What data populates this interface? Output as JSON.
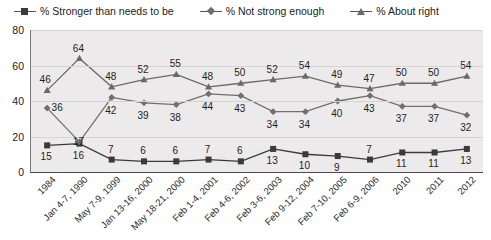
{
  "legend": {
    "position": "top",
    "entries": [
      {
        "label": "% Stronger than needs to be",
        "marker": "square-marker-icon",
        "color": "#3a3a3a"
      },
      {
        "label": "% Not strong enough",
        "marker": "diamond-marker-icon",
        "color": "#6f6f6f"
      },
      {
        "label": "% About right",
        "marker": "triangle-marker-icon",
        "color": "#6a6a6a"
      }
    ]
  },
  "chart_data": {
    "type": "line",
    "title": "",
    "xlabel": "",
    "ylabel": "",
    "ylim": [
      0,
      80
    ],
    "yticks": [
      0,
      20,
      40,
      60,
      80
    ],
    "grid": true,
    "legend_position": "top",
    "categories": [
      "1984",
      "Jan 4-7, 1990",
      "May 7-9, 1999",
      "Jan 13-16, 2000",
      "May 18-21, 2000",
      "Feb 1-4, 2001",
      "Feb 4-6, 2002",
      "Feb 3-6, 2003",
      "Feb 9-12, 2004",
      "Feb 7-10, 2005",
      "Feb 6-9, 2006",
      "2010",
      "2011",
      "2012"
    ],
    "series": [
      {
        "name": "% Stronger than needs to be",
        "marker": "square",
        "color": "#3a3a3a",
        "values": [
          15,
          16,
          7,
          6,
          6,
          7,
          6,
          13,
          10,
          9,
          7,
          11,
          11,
          13
        ]
      },
      {
        "name": "% Not strong enough",
        "marker": "diamond",
        "color": "#6f6f6f",
        "values": [
          36,
          17,
          42,
          39,
          38,
          44,
          43,
          34,
          34,
          40,
          43,
          37,
          37,
          32
        ]
      },
      {
        "name": "% About right",
        "marker": "triangle",
        "color": "#6a6a6a",
        "values": [
          46,
          64,
          48,
          52,
          55,
          48,
          50,
          52,
          54,
          49,
          47,
          50,
          50,
          54
        ]
      }
    ]
  }
}
